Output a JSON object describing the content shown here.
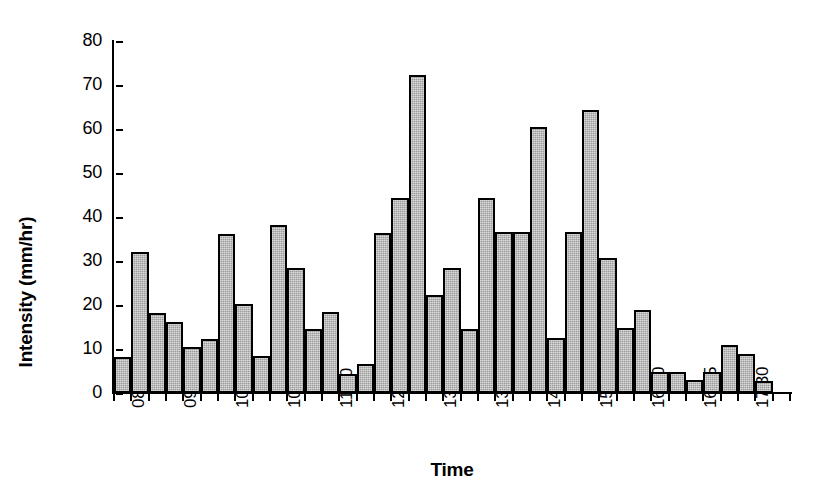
{
  "chart_data": {
    "type": "bar",
    "title": "",
    "xlabel": "Time",
    "ylabel": "Intensity (mm/hr)",
    "ylim": [
      0,
      80
    ],
    "ytick_values": [
      0,
      10,
      20,
      30,
      40,
      50,
      60,
      70,
      80
    ],
    "ytick_labels": [
      "0",
      "10",
      "20",
      "30",
      "40",
      "50",
      "60",
      "70",
      "80"
    ],
    "grid": false,
    "legend": null,
    "bar_color": "#9b9b9b",
    "bar_edge_color": "#000000",
    "axis_color": "#000000",
    "xtick_labels": [
      "08:30",
      "09:15",
      "10:00",
      "10:45",
      "11:30",
      "12:15",
      "13:00",
      "13:45",
      "14:30",
      "15:15",
      "16:00",
      "16:45",
      "17:30"
    ],
    "xtick_indices": [
      0,
      3,
      6,
      9,
      12,
      15,
      18,
      21,
      24,
      27,
      30,
      33,
      36
    ],
    "categories": [
      "08:30",
      "08:45",
      "09:00",
      "09:15",
      "09:30",
      "09:45",
      "10:00",
      "10:15",
      "10:30",
      "10:45",
      "11:00",
      "11:15",
      "11:30",
      "11:45",
      "12:00",
      "12:15",
      "12:30",
      "12:45",
      "13:00",
      "13:15",
      "13:30",
      "13:45",
      "14:00",
      "14:15",
      "14:30",
      "14:45",
      "15:00",
      "15:15",
      "15:30",
      "15:45",
      "16:00",
      "16:15",
      "16:30",
      "16:45",
      "17:00",
      "17:15",
      "17:30",
      "17:45",
      "18:00"
    ],
    "values": [
      8.2,
      32.1,
      18.1,
      16.2,
      10.4,
      12.3,
      36.2,
      20.3,
      8.3,
      38.2,
      28.3,
      14.5,
      18.4,
      4.4,
      6.5,
      36.3,
      44.3,
      72.3,
      22.3,
      28.4,
      14.6,
      44.4,
      36.6,
      36.6,
      60.4,
      12.6,
      36.5,
      64.3,
      30.7,
      14.7,
      18.8,
      4.7,
      4.7,
      3.0,
      4.7,
      10.8,
      8.8,
      2.8,
      0.0
    ]
  }
}
